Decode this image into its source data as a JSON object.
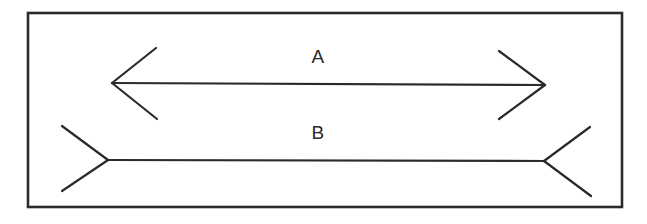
{
  "figure": {
    "background_color": "#ffffff",
    "stroke_color": "#2b2b2b",
    "border": {
      "name": "outer-frame",
      "x": 28,
      "y": 13,
      "width": 594,
      "height": 194,
      "stroke_width": 2.6
    },
    "labels": [
      {
        "text": "A",
        "x": 318,
        "y": 58
      },
      {
        "text": "B",
        "x": 318,
        "y": 134
      }
    ],
    "lines": [
      {
        "id": "line-a",
        "label": "A",
        "arrow_style": "outward-arrowheads",
        "shaft": {
          "x1": 112,
          "y1": 83,
          "x2": 545,
          "y2": 85
        },
        "stroke_width": 2.2,
        "fins": [
          {
            "name": "left-upper-fin",
            "x1": 112,
            "y1": 83,
            "x2": 156,
            "y2": 48
          },
          {
            "name": "left-lower-fin",
            "x1": 112,
            "y1": 83,
            "x2": 157,
            "y2": 119
          },
          {
            "name": "right-upper-fin",
            "x1": 545,
            "y1": 85,
            "x2": 499,
            "y2": 51
          },
          {
            "name": "right-lower-fin",
            "x1": 545,
            "y1": 85,
            "x2": 499,
            "y2": 119
          }
        ]
      },
      {
        "id": "line-b",
        "label": "B",
        "arrow_style": "inward-arrowheads",
        "shaft": {
          "x1": 108,
          "y1": 160,
          "x2": 544,
          "y2": 161
        },
        "stroke_width": 2.2,
        "fins": [
          {
            "name": "left-upper-fin",
            "x1": 108,
            "y1": 160,
            "x2": 62,
            "y2": 126
          },
          {
            "name": "left-lower-fin",
            "x1": 108,
            "y1": 160,
            "x2": 62,
            "y2": 191
          },
          {
            "name": "right-upper-fin",
            "x1": 544,
            "y1": 161,
            "x2": 590,
            "y2": 127
          },
          {
            "name": "right-lower-fin",
            "x1": 544,
            "y1": 161,
            "x2": 591,
            "y2": 196
          }
        ]
      }
    ]
  }
}
